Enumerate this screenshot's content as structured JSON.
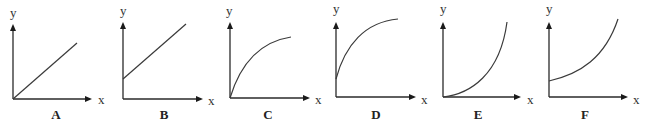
{
  "figure": {
    "graphs": [
      {
        "id": "A",
        "label": "A",
        "x_axis_label": "x",
        "y_axis_label": "y",
        "shape": "straight line through origin",
        "origin": [
          13,
          99
        ],
        "x_axis_end": 92,
        "y_axis_end": 24,
        "path": "M13,99 L77,43",
        "y_label_pos": [
          10,
          17
        ],
        "x_label_pos": [
          98,
          104
        ],
        "letter_pos": [
          56,
          119
        ]
      },
      {
        "id": "B",
        "label": "B",
        "x_axis_label": "x",
        "y_axis_label": "y",
        "shape": "straight line with positive y-intercept",
        "origin": [
          123,
          99
        ],
        "x_axis_end": 203,
        "y_axis_end": 22,
        "path": "M123,79 L186,24",
        "y_label_pos": [
          120,
          15
        ],
        "x_label_pos": [
          208,
          105
        ],
        "letter_pos": [
          164,
          119
        ]
      },
      {
        "id": "C",
        "label": "C",
        "x_axis_label": "x",
        "y_axis_label": "y",
        "shape": "concave-down curve from origin",
        "origin": [
          230,
          98
        ],
        "x_axis_end": 310,
        "y_axis_end": 22,
        "path": "M230,98 C240,65 258,42 291,37",
        "y_label_pos": [
          226,
          15
        ],
        "x_label_pos": [
          315,
          104
        ],
        "letter_pos": [
          268,
          119
        ]
      },
      {
        "id": "D",
        "label": "D",
        "x_axis_label": "x",
        "y_axis_label": "y",
        "shape": "concave-down curve with positive y-intercept",
        "origin": [
          336,
          97
        ],
        "x_axis_end": 416,
        "y_axis_end": 22,
        "path": "M336,79 C345,45 365,22 398,19",
        "y_label_pos": [
          333,
          13
        ],
        "x_label_pos": [
          421,
          104
        ],
        "letter_pos": [
          376,
          119
        ]
      },
      {
        "id": "E",
        "label": "E",
        "x_axis_label": "x",
        "y_axis_label": "y",
        "shape": "concave-up curve from origin",
        "origin": [
          443,
          97
        ],
        "x_axis_end": 521,
        "y_axis_end": 22,
        "path": "M443,97 C470,94 500,75 507,22",
        "y_label_pos": [
          440,
          13
        ],
        "x_label_pos": [
          527,
          104
        ],
        "letter_pos": [
          478,
          119
        ]
      },
      {
        "id": "F",
        "label": "F",
        "x_axis_label": "x",
        "y_axis_label": "y",
        "shape": "concave-up curve with positive y-intercept",
        "origin": [
          549,
          97
        ],
        "x_axis_end": 628,
        "y_axis_end": 22,
        "path": "M549,81 C580,74 605,58 618,19",
        "y_label_pos": [
          546,
          13
        ],
        "x_label_pos": [
          633,
          104
        ],
        "letter_pos": [
          585,
          119
        ]
      }
    ]
  }
}
